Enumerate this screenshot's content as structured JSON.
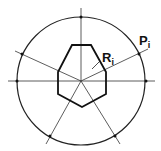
{
  "diagram": {
    "center": [
      81,
      81
    ],
    "circle_radius": 64,
    "polygon_points": "72,45 91,45 106,72 106,94 82,107 58,94 58,72",
    "rays_through_center": [
      {
        "x1": 81,
        "y1": 8,
        "x2": 81,
        "y2": 81
      },
      {
        "x1": 8,
        "y1": 81,
        "x2": 155,
        "y2": 81
      },
      {
        "x1": 15,
        "y1": 51,
        "x2": 81,
        "y2": 81
      },
      {
        "x1": 81,
        "y1": 81,
        "x2": 148,
        "y2": 49
      },
      {
        "x1": 81,
        "y1": 81,
        "x2": 46,
        "y2": 144
      },
      {
        "x1": 81,
        "y1": 81,
        "x2": 120,
        "y2": 144
      }
    ],
    "intersection_dots": [
      [
        81,
        17
      ],
      [
        17,
        81
      ],
      [
        146,
        81
      ],
      [
        22,
        54
      ],
      [
        139,
        54
      ],
      [
        50,
        136
      ],
      [
        115,
        136
      ]
    ],
    "leader": {
      "x1": 92,
      "y1": 69,
      "x2": 100,
      "y2": 61
    },
    "labels": {
      "r_main": "R",
      "r_sub": "i",
      "p_main": "P",
      "p_sub": "i"
    },
    "stroke_color": "#222222"
  }
}
